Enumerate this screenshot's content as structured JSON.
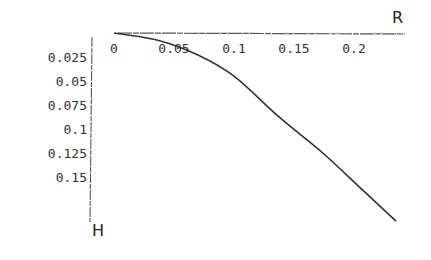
{
  "chart_data": {
    "type": "line",
    "title": "",
    "xlabel": "R",
    "ylabel": "H",
    "x_axis_position": "top",
    "y_axis_inverted": true,
    "xlim": [
      0,
      0.24
    ],
    "ylim": [
      0,
      0.2
    ],
    "x_ticks": [
      0,
      0.05,
      0.1,
      0.15,
      0.2
    ],
    "x_tick_labels": [
      "0",
      "0.05",
      "0.1",
      "0.15",
      "0.2"
    ],
    "y_ticks": [
      0.025,
      0.05,
      0.075,
      0.1,
      0.125,
      0.15
    ],
    "y_tick_labels": [
      "0.025",
      "0.05",
      "0.075",
      "0.1",
      "0.125",
      "0.15"
    ],
    "grid": false,
    "legend": null,
    "series": [
      {
        "name": "H(R)",
        "color": "#333333",
        "x": [
          0,
          0.038,
          0.07,
          0.1,
          0.138,
          0.174,
          0.205,
          0.235
        ],
        "y": [
          0,
          0.008,
          0.023,
          0.045,
          0.088,
          0.125,
          0.161,
          0.196
        ]
      }
    ]
  }
}
